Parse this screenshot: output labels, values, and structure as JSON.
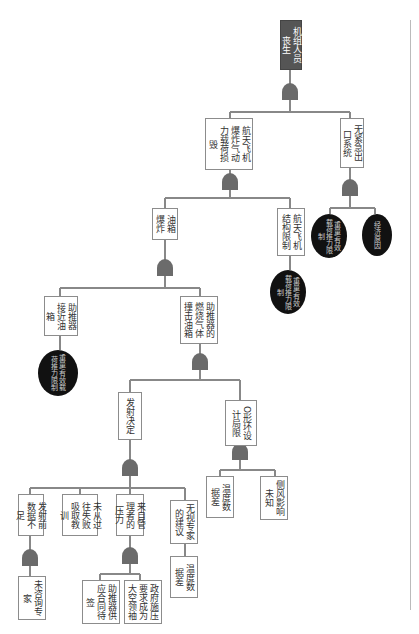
{
  "diagram": {
    "type": "fault-tree",
    "orientation": "rotated-90",
    "top_event": "机组人员丧生",
    "nodes": {
      "top": "机组人员丧生",
      "n_airload": "航天飞机爆炸气动力载荷损毁",
      "n_noescape": "无紧急出口系统",
      "b_weight1": "重量/有效载荷推力限制",
      "b_econ": "经济原因",
      "n_tank": "油箱爆炸",
      "n_struct": "航天飞机结构限制",
      "b_weight2": "重量/有效载荷推力限制",
      "n_booster_near": "助推器接近油箱",
      "b_weight3": "重量/有效载荷推力限制",
      "n_gas_hit": "助推器的燃烧气体撞击油箱",
      "n_launch": "发射决定",
      "n_oring": "O形环设计局限",
      "n_data_insuf": "发射前数据不足",
      "n_no_lesson": "未从过往失败吸取教训",
      "n_pressure": "来自管理者的压力",
      "n_ignore_expert": "无视专家的建议",
      "n_temp1": "温度数据差",
      "n_crosswind": "侧风影响未知",
      "n_no_consult": "未咨询专家",
      "n_booster_contract": "助推器供应合同待签",
      "n_gov_pressure": "政府施压要求成为大空领袖",
      "n_temp2": "温度数据差"
    },
    "gate_type": "AND"
  }
}
